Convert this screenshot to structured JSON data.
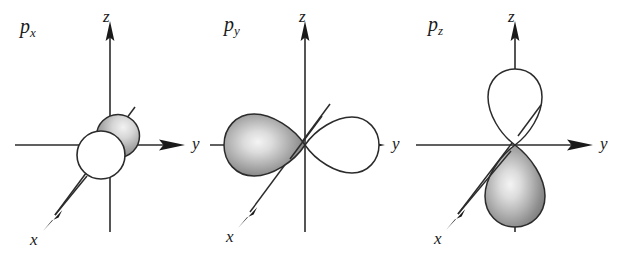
{
  "figure": {
    "background_color": "#ffffff",
    "stroke_color": "#2b2b2b",
    "lobe_fill_white": "#ffffff",
    "lobe_fill_shaded": "#9a9a9a",
    "width": 640,
    "height": 260
  },
  "panels": [
    {
      "id": "px",
      "label_base": "p",
      "label_sub": "x",
      "orbital_type": "p",
      "orientation": "x",
      "description": "two circles viewed end-on along x axis",
      "axes": {
        "z": "z",
        "y": "y",
        "x": "x"
      },
      "lobes": [
        {
          "name": "near-lobe",
          "shading": "shaded"
        },
        {
          "name": "far-lobe",
          "shading": "white"
        }
      ]
    },
    {
      "id": "py",
      "label_base": "p",
      "label_sub": "y",
      "orbital_type": "p",
      "orientation": "y",
      "description": "two teardrop lobes along the horizontal y axis",
      "axes": {
        "z": "z",
        "y": "y",
        "x": "x"
      },
      "lobes": [
        {
          "name": "negative-y-lobe",
          "shading": "shaded"
        },
        {
          "name": "positive-y-lobe",
          "shading": "white"
        }
      ]
    },
    {
      "id": "pz",
      "label_base": "p",
      "label_sub": "z",
      "orbital_type": "p",
      "orientation": "z",
      "description": "two teardrop lobes along the vertical z axis",
      "axes": {
        "z": "z",
        "y": "y",
        "x": "x"
      },
      "lobes": [
        {
          "name": "positive-z-lobe",
          "shading": "white"
        },
        {
          "name": "negative-z-lobe",
          "shading": "shaded"
        }
      ]
    }
  ]
}
